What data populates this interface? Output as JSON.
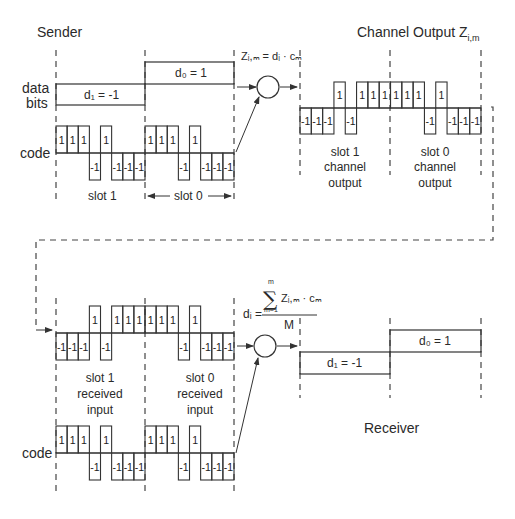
{
  "titles": {
    "sender": "Sender",
    "channel_output": "Channel Output Z",
    "channel_output_sub": "i,m",
    "receiver": "Receiver"
  },
  "labels": {
    "data_bits_line1": "data",
    "data_bits_line2": "bits",
    "code_top": "code",
    "code_bottom": "code",
    "slot1": "slot 1",
    "slot0": "slot 0",
    "slot1_channel": [
      "slot 1",
      "channel",
      "output"
    ],
    "slot0_channel": [
      "slot 0",
      "channel",
      "output"
    ],
    "slot1_received": [
      "slot 1",
      "received",
      "input"
    ],
    "slot0_received": [
      "slot 0",
      "received",
      "input"
    ]
  },
  "data_bits": {
    "d1": "d₁ = -1",
    "d0": "d₀ = 1",
    "d1_value": -1,
    "d0_value": 1
  },
  "formulas": {
    "encode": "Zᵢ,ₘ = dᵢ · cₘ",
    "decode_lhs": "dᵢ =",
    "decode_sum_top": "m",
    "decode_sum_bottom": "m=1",
    "decode_numerator": "Zᵢ,ₘ · cₘ",
    "decode_denominator": "M"
  },
  "code_sequence": [
    1,
    1,
    1,
    -1,
    1,
    -1,
    -1,
    -1
  ],
  "sender_code_chips": [
    1,
    1,
    1,
    -1,
    1,
    -1,
    -1,
    -1,
    1,
    1,
    1,
    -1,
    1,
    -1,
    -1,
    -1
  ],
  "channel_output_chips": [
    -1,
    -1,
    -1,
    1,
    -1,
    1,
    1,
    1,
    1,
    1,
    1,
    -1,
    1,
    -1,
    -1,
    -1
  ],
  "received_input_chips": [
    -1,
    -1,
    -1,
    1,
    -1,
    1,
    1,
    1,
    1,
    1,
    1,
    -1,
    1,
    -1,
    -1,
    -1
  ],
  "receiver_code_chips": [
    1,
    1,
    1,
    -1,
    1,
    -1,
    -1,
    -1,
    1,
    1,
    1,
    -1,
    1,
    -1,
    -1,
    -1
  ],
  "colors": {
    "line": "#333333",
    "dash": "#444444",
    "background": "#ffffff"
  }
}
